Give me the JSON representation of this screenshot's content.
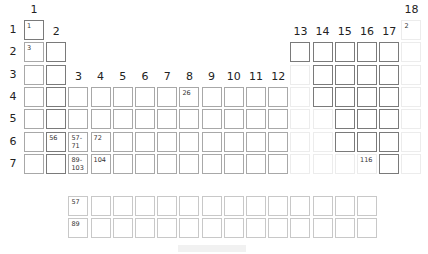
{
  "groups": [
    "1",
    "2",
    "3",
    "4",
    "5",
    "6",
    "7",
    "8",
    "9",
    "10",
    "11",
    "12",
    "13",
    "14",
    "15",
    "16",
    "17",
    "18"
  ],
  "periods": [
    "1",
    "2",
    "3",
    "4",
    "5",
    "6",
    "7"
  ],
  "cells": [
    {
      "g": 1,
      "p": 1,
      "s": "dark",
      "n": "1"
    },
    {
      "g": 18,
      "p": 1,
      "s": "faint",
      "n": "2"
    },
    {
      "g": 1,
      "p": 2,
      "s": "mid",
      "n": "3"
    },
    {
      "g": 2,
      "p": 2,
      "s": "dark",
      "n": ""
    },
    {
      "g": 13,
      "p": 2,
      "s": "dark",
      "n": ""
    },
    {
      "g": 14,
      "p": 2,
      "s": "dark",
      "n": ""
    },
    {
      "g": 15,
      "p": 2,
      "s": "dark",
      "n": ""
    },
    {
      "g": 16,
      "p": 2,
      "s": "dark",
      "n": ""
    },
    {
      "g": 17,
      "p": 2,
      "s": "dark",
      "n": ""
    },
    {
      "g": 18,
      "p": 2,
      "s": "faint",
      "n": ""
    },
    {
      "g": 1,
      "p": 3,
      "s": "mid",
      "n": ""
    },
    {
      "g": 2,
      "p": 3,
      "s": "dark",
      "n": ""
    },
    {
      "g": 13,
      "p": 3,
      "s": "faint",
      "n": ""
    },
    {
      "g": 14,
      "p": 3,
      "s": "dark",
      "n": ""
    },
    {
      "g": 15,
      "p": 3,
      "s": "dark",
      "n": ""
    },
    {
      "g": 16,
      "p": 3,
      "s": "dark",
      "n": ""
    },
    {
      "g": 17,
      "p": 3,
      "s": "dark",
      "n": ""
    },
    {
      "g": 18,
      "p": 3,
      "s": "faint",
      "n": ""
    },
    {
      "g": 1,
      "p": 4,
      "s": "mid",
      "n": ""
    },
    {
      "g": 2,
      "p": 4,
      "s": "dark",
      "n": ""
    },
    {
      "g": 3,
      "p": 4,
      "s": "mid",
      "n": ""
    },
    {
      "g": 4,
      "p": 4,
      "s": "mid",
      "n": ""
    },
    {
      "g": 5,
      "p": 4,
      "s": "mid",
      "n": ""
    },
    {
      "g": 6,
      "p": 4,
      "s": "mid",
      "n": ""
    },
    {
      "g": 7,
      "p": 4,
      "s": "mid",
      "n": ""
    },
    {
      "g": 8,
      "p": 4,
      "s": "mid",
      "n": "26"
    },
    {
      "g": 9,
      "p": 4,
      "s": "mid",
      "n": ""
    },
    {
      "g": 10,
      "p": 4,
      "s": "mid",
      "n": ""
    },
    {
      "g": 11,
      "p": 4,
      "s": "mid",
      "n": ""
    },
    {
      "g": 12,
      "p": 4,
      "s": "mid",
      "n": ""
    },
    {
      "g": 13,
      "p": 4,
      "s": "faint",
      "n": ""
    },
    {
      "g": 14,
      "p": 4,
      "s": "dark",
      "n": ""
    },
    {
      "g": 15,
      "p": 4,
      "s": "dark",
      "n": ""
    },
    {
      "g": 16,
      "p": 4,
      "s": "dark",
      "n": ""
    },
    {
      "g": 17,
      "p": 4,
      "s": "dark",
      "n": ""
    },
    {
      "g": 18,
      "p": 4,
      "s": "faint",
      "n": ""
    },
    {
      "g": 1,
      "p": 5,
      "s": "mid",
      "n": ""
    },
    {
      "g": 2,
      "p": 5,
      "s": "dark",
      "n": ""
    },
    {
      "g": 3,
      "p": 5,
      "s": "mid",
      "n": ""
    },
    {
      "g": 4,
      "p": 5,
      "s": "mid",
      "n": ""
    },
    {
      "g": 5,
      "p": 5,
      "s": "mid",
      "n": ""
    },
    {
      "g": 6,
      "p": 5,
      "s": "mid",
      "n": ""
    },
    {
      "g": 7,
      "p": 5,
      "s": "mid",
      "n": ""
    },
    {
      "g": 8,
      "p": 5,
      "s": "mid",
      "n": ""
    },
    {
      "g": 9,
      "p": 5,
      "s": "mid",
      "n": ""
    },
    {
      "g": 10,
      "p": 5,
      "s": "mid",
      "n": ""
    },
    {
      "g": 11,
      "p": 5,
      "s": "mid",
      "n": ""
    },
    {
      "g": 12,
      "p": 5,
      "s": "mid",
      "n": ""
    },
    {
      "g": 13,
      "p": 5,
      "s": "faint",
      "n": ""
    },
    {
      "g": 14,
      "p": 5,
      "s": "faint",
      "n": ""
    },
    {
      "g": 15,
      "p": 5,
      "s": "dark",
      "n": ""
    },
    {
      "g": 16,
      "p": 5,
      "s": "dark",
      "n": ""
    },
    {
      "g": 17,
      "p": 5,
      "s": "dark",
      "n": ""
    },
    {
      "g": 18,
      "p": 5,
      "s": "faint",
      "n": ""
    },
    {
      "g": 1,
      "p": 6,
      "s": "mid",
      "n": ""
    },
    {
      "g": 2,
      "p": 6,
      "s": "dark",
      "n": "56"
    },
    {
      "g": 3,
      "p": 6,
      "s": "mid",
      "n": "57-\n71"
    },
    {
      "g": 4,
      "p": 6,
      "s": "mid",
      "n": "72"
    },
    {
      "g": 5,
      "p": 6,
      "s": "mid",
      "n": ""
    },
    {
      "g": 6,
      "p": 6,
      "s": "mid",
      "n": ""
    },
    {
      "g": 7,
      "p": 6,
      "s": "mid",
      "n": ""
    },
    {
      "g": 8,
      "p": 6,
      "s": "mid",
      "n": ""
    },
    {
      "g": 9,
      "p": 6,
      "s": "mid",
      "n": ""
    },
    {
      "g": 10,
      "p": 6,
      "s": "mid",
      "n": ""
    },
    {
      "g": 11,
      "p": 6,
      "s": "mid",
      "n": ""
    },
    {
      "g": 12,
      "p": 6,
      "s": "mid",
      "n": ""
    },
    {
      "g": 13,
      "p": 6,
      "s": "faint",
      "n": ""
    },
    {
      "g": 14,
      "p": 6,
      "s": "faint",
      "n": ""
    },
    {
      "g": 15,
      "p": 6,
      "s": "dark",
      "n": ""
    },
    {
      "g": 16,
      "p": 6,
      "s": "dark",
      "n": ""
    },
    {
      "g": 17,
      "p": 6,
      "s": "dark",
      "n": ""
    },
    {
      "g": 18,
      "p": 6,
      "s": "faint",
      "n": ""
    },
    {
      "g": 1,
      "p": 7,
      "s": "mid",
      "n": ""
    },
    {
      "g": 2,
      "p": 7,
      "s": "dark",
      "n": ""
    },
    {
      "g": 3,
      "p": 7,
      "s": "mid",
      "n": "89-\n103"
    },
    {
      "g": 4,
      "p": 7,
      "s": "mid",
      "n": "104"
    },
    {
      "g": 5,
      "p": 7,
      "s": "mid",
      "n": ""
    },
    {
      "g": 6,
      "p": 7,
      "s": "mid",
      "n": ""
    },
    {
      "g": 7,
      "p": 7,
      "s": "mid",
      "n": ""
    },
    {
      "g": 8,
      "p": 7,
      "s": "mid",
      "n": ""
    },
    {
      "g": 9,
      "p": 7,
      "s": "mid",
      "n": ""
    },
    {
      "g": 10,
      "p": 7,
      "s": "mid",
      "n": ""
    },
    {
      "g": 11,
      "p": 7,
      "s": "mid",
      "n": ""
    },
    {
      "g": 12,
      "p": 7,
      "s": "mid",
      "n": ""
    },
    {
      "g": 13,
      "p": 7,
      "s": "faint",
      "n": ""
    },
    {
      "g": 14,
      "p": 7,
      "s": "faint",
      "n": ""
    },
    {
      "g": 15,
      "p": 7,
      "s": "faint",
      "n": ""
    },
    {
      "g": 16,
      "p": 7,
      "s": "faint",
      "n": "116"
    },
    {
      "g": 17,
      "p": 7,
      "s": "dark",
      "n": ""
    },
    {
      "g": 18,
      "p": 7,
      "s": "faint",
      "n": ""
    }
  ],
  "fblock": {
    "lanthanides": {
      "first_number": "57",
      "count": 14
    },
    "actinides": {
      "first_number": "89",
      "count": 14
    }
  }
}
